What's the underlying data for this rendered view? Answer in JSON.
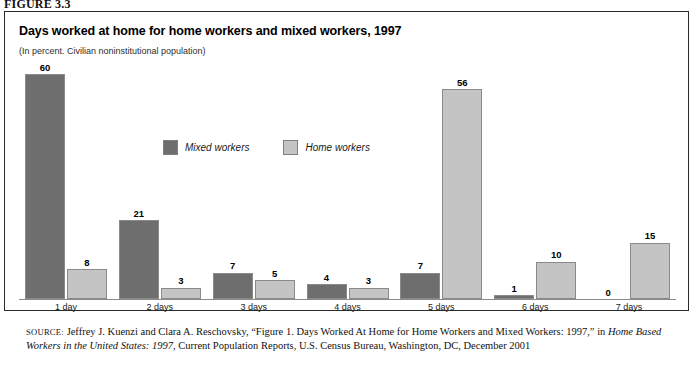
{
  "figure_label": "FIGURE 3.3",
  "chart": {
    "title": "Days worked at home for home workers and mixed workers, 1997",
    "subtitle": "(In percent. Civilian noninstitutional population)"
  },
  "legend": {
    "items": [
      {
        "label": "Mixed workers",
        "color": "#6e6e6e"
      },
      {
        "label": "Home workers",
        "color": "#c4c4c4"
      }
    ]
  },
  "source": {
    "prefix": "SOURCE:",
    "part1": " Jeffrey J. Kuenzi and Clara A. Reschovsky, “Figure 1. Days Worked At Home for Home Workers and Mixed Workers: 1997,” in ",
    "italic1": "Home Based Workers in the United States: 1997",
    "part2": ", Current Population Reports, U.S. Census Bureau, Washington, DC, December 2001"
  },
  "chart_data": {
    "type": "bar",
    "title": "Days worked at home for home workers and mixed workers, 1997",
    "subtitle": "(In percent. Civilian noninstitutional population)",
    "xlabel": "",
    "ylabel": "Percent",
    "ylim": [
      0,
      60
    ],
    "grid": false,
    "legend_position": "upper-center",
    "categories": [
      "1 day",
      "2 days",
      "3 days",
      "4 days",
      "5 days",
      "6 days",
      "7 days"
    ],
    "series": [
      {
        "name": "Mixed workers",
        "color": "#6e6e6e",
        "values": [
          60,
          21,
          7,
          4,
          7,
          1,
          0
        ]
      },
      {
        "name": "Home workers",
        "color": "#c4c4c4",
        "values": [
          8,
          3,
          5,
          3,
          56,
          10,
          15
        ]
      }
    ],
    "labels": {
      "mixed": [
        "60",
        "21",
        "7",
        "4",
        "7",
        "1",
        "0"
      ],
      "home": [
        "8",
        "3",
        "5",
        "3",
        "56",
        "10",
        "15"
      ]
    }
  }
}
